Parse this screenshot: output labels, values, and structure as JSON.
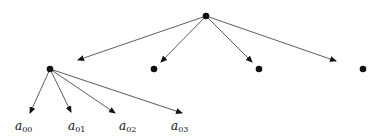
{
  "diagram": {
    "type": "tree",
    "colors": {
      "ink": "#111111",
      "background": "#ffffff"
    },
    "nodes": [
      {
        "id": "root",
        "x": 206,
        "y": 16
      },
      {
        "id": "c0",
        "x": 50,
        "y": 69
      },
      {
        "id": "c1",
        "x": 154,
        "y": 69
      },
      {
        "id": "c2",
        "x": 259,
        "y": 69
      },
      {
        "id": "c3",
        "x": 363,
        "y": 69
      }
    ],
    "leaves": [
      {
        "label": "a",
        "sub": "00",
        "x": 28,
        "y": 127
      },
      {
        "label": "a",
        "sub": "01",
        "x": 72,
        "y": 127
      },
      {
        "label": "a",
        "sub": "02",
        "x": 124,
        "y": 127
      },
      {
        "label": "a",
        "sub": "03",
        "x": 176,
        "y": 127
      }
    ]
  }
}
